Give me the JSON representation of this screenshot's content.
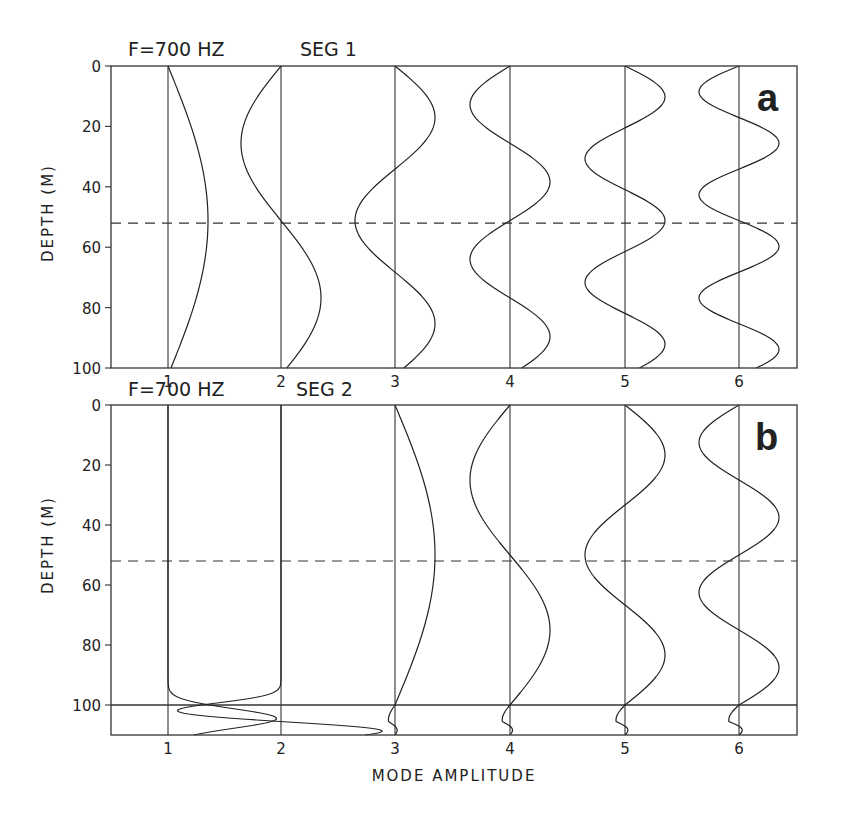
{
  "chart_data": [
    {
      "type": "line",
      "panel": "a",
      "title_left": "F=700 HZ",
      "title_right": "SEG 1",
      "ylabel": "DEPTH (M)",
      "xlabel": "",
      "yticks": [
        0,
        20,
        40,
        60,
        80,
        100
      ],
      "ylim": [
        0,
        100
      ],
      "xticks": [
        "1",
        "2",
        "3",
        "4",
        "5",
        "6"
      ],
      "dashed_line_depth": 52,
      "mode_depth_scale": 102.4,
      "mode_amplitude_px": 40,
      "series": [
        {
          "name": "Mode 1",
          "baseline": 1,
          "sign": 1,
          "half_waves": 1
        },
        {
          "name": "Mode 2",
          "baseline": 2,
          "sign": -1,
          "half_waves": 2
        },
        {
          "name": "Mode 3",
          "baseline": 3,
          "sign": 1,
          "half_waves": 3
        },
        {
          "name": "Mode 4",
          "baseline": 4,
          "sign": -1,
          "half_waves": 4
        },
        {
          "name": "Mode 5",
          "baseline": 5,
          "sign": 1,
          "half_waves": 5
        },
        {
          "name": "Mode 6",
          "baseline": 6,
          "sign": -1,
          "half_waves": 6
        }
      ],
      "annotation": "a"
    },
    {
      "type": "line",
      "panel": "b",
      "title_left": "F=700 HZ",
      "title_right": "SEG 2",
      "ylabel": "DEPTH (M)",
      "xlabel": "MODE AMPLITUDE",
      "yticks": [
        0,
        20,
        40,
        60,
        80,
        100
      ],
      "ylim": [
        0,
        110
      ],
      "xticks": [
        "1",
        "2",
        "3",
        "4",
        "5",
        "6"
      ],
      "dashed_line_depth": 52,
      "layer_boundary_depth": 100,
      "mode_amplitude_px": 40,
      "series": [
        {
          "name": "Mode 1",
          "baseline": 1,
          "trapped_in_bottom_layer": true,
          "peak_depth": 104.5,
          "peak_offset": 0.96
        },
        {
          "name": "Mode 2",
          "baseline": 2,
          "trapped_in_bottom_layer": true,
          "left_peak_depth": 102,
          "left_peak_offset": -0.93,
          "right_peak_depth": 108.5,
          "right_peak_offset": 0.94
        },
        {
          "name": "Mode 3",
          "baseline": 3,
          "sign": 1,
          "half_waves_water": 1
        },
        {
          "name": "Mode 4",
          "baseline": 4,
          "sign": -1,
          "half_waves_water": 2
        },
        {
          "name": "Mode 5",
          "baseline": 5,
          "sign": 1,
          "half_waves_water": 3
        },
        {
          "name": "Mode 6",
          "baseline": 6,
          "sign": -1,
          "half_waves_water": 4
        }
      ],
      "annotation": "b"
    }
  ]
}
